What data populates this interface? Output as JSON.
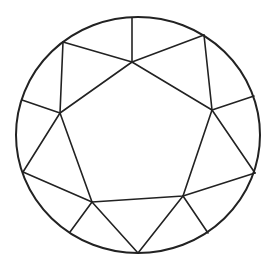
{
  "diagram": {
    "colors": {
      "stroke": "#222222",
      "background": "#ffffff"
    },
    "girdle": {
      "cx": 138,
      "cy": 135,
      "rx": 122,
      "ry": 118
    },
    "table": [
      [
        132,
        62
      ],
      [
        212,
        110
      ],
      [
        183,
        196
      ],
      [
        92,
        202
      ],
      [
        60,
        113
      ]
    ],
    "facet_lines": [
      [
        [
          63,
          42
        ],
        [
          132,
          62
        ]
      ],
      [
        [
          132,
          18
        ],
        [
          132,
          62
        ]
      ],
      [
        [
          204,
          35
        ],
        [
          132,
          62
        ]
      ],
      [
        [
          204,
          35
        ],
        [
          212,
          110
        ]
      ],
      [
        [
          254,
          96
        ],
        [
          212,
          110
        ]
      ],
      [
        [
          212,
          110
        ],
        [
          255,
          173
        ]
      ],
      [
        [
          255,
          173
        ],
        [
          183,
          196
        ]
      ],
      [
        [
          183,
          196
        ],
        [
          208,
          233
        ]
      ],
      [
        [
          183,
          196
        ],
        [
          138,
          253
        ]
      ],
      [
        [
          92,
          202
        ],
        [
          138,
          253
        ]
      ],
      [
        [
          92,
          202
        ],
        [
          70,
          232
        ]
      ],
      [
        [
          92,
          202
        ],
        [
          23,
          172
        ]
      ],
      [
        [
          23,
          172
        ],
        [
          60,
          113
        ]
      ],
      [
        [
          22,
          100
        ],
        [
          60,
          113
        ]
      ],
      [
        [
          63,
          42
        ],
        [
          60,
          113
        ]
      ]
    ]
  }
}
